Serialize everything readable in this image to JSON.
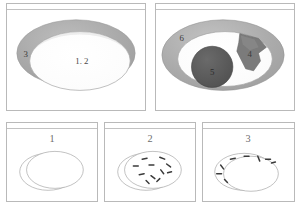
{
  "figure": {
    "background_color": "#ffffff",
    "panel_border_color": "#b9b9b9",
    "palette": {
      "rim_gray": "#a9a9a9",
      "rim_gray_light": "#b5b5b5",
      "lesion_dark_gray": "#6d6d6d",
      "nodule_dark": "#565656",
      "outline": "#9a9a9a",
      "label_text": "#3b3b3b"
    }
  },
  "panels": [
    {
      "id": "panel-top-left",
      "caption": "",
      "description": "Oblique view of a circular cavity with a broad gray rim and a pale central lumen",
      "labels": [
        {
          "key": "rim",
          "text": "3"
        },
        {
          "key": "lumen",
          "text": "1. 2"
        }
      ]
    },
    {
      "id": "panel-top-right",
      "caption": "",
      "description": "Same cavity with a shaded rim, an irregular gray plaque and a dark round nodule inside the lumen",
      "labels": [
        {
          "key": "rim",
          "text": "6"
        },
        {
          "key": "plaque",
          "text": "4"
        },
        {
          "key": "nodule",
          "text": "5"
        }
      ]
    },
    {
      "id": "panel-bottom-1",
      "caption": "1",
      "description": "Line-drawing schematic: plain double ellipse, no markings",
      "labels": []
    },
    {
      "id": "panel-bottom-2",
      "caption": "2",
      "description": "Line-drawing schematic: short dark dashes scattered across the inner ellipse",
      "labels": []
    },
    {
      "id": "panel-bottom-3",
      "caption": "3",
      "description": "Line-drawing schematic: short dark dashes arranged around the rim band only",
      "labels": []
    }
  ]
}
